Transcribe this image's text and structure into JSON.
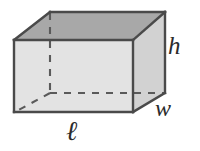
{
  "figure": {
    "shape_name": "rectangular-prism",
    "background_color": "#ffffff",
    "stroke_color": "#4a4a4a",
    "dashed_stroke_color": "#5a5a5a",
    "faces": {
      "top": {
        "name": "top-face",
        "fill": "#a8a8a8"
      },
      "front": {
        "name": "front-face",
        "fill": "#e3e3e3"
      },
      "right": {
        "name": "right-face",
        "fill": "#d2d2d2"
      }
    },
    "labels": [
      {
        "id": "h",
        "text": "h",
        "meaning": "height",
        "x": 175,
        "y": 48
      },
      {
        "id": "w",
        "text": "w",
        "meaning": "width",
        "x": 164,
        "y": 108
      },
      {
        "id": "l",
        "text": "ℓ",
        "meaning": "length",
        "x": 76,
        "y": 131
      }
    ],
    "vertices": {
      "front_top_left": [
        14,
        40
      ],
      "front_top_right": [
        133,
        40
      ],
      "front_bottom_left": [
        14,
        112
      ],
      "front_bottom_right": [
        133,
        112
      ],
      "back_top_left": [
        50,
        12
      ],
      "back_top_right": [
        165,
        12
      ],
      "back_bottom_left": [
        50,
        93
      ],
      "back_bottom_right": [
        165,
        93
      ]
    },
    "hidden_edges": [
      "back_top_left-back_bottom_left",
      "back_bottom_left-back_bottom_right",
      "back_bottom_left-front_bottom_left"
    ]
  }
}
